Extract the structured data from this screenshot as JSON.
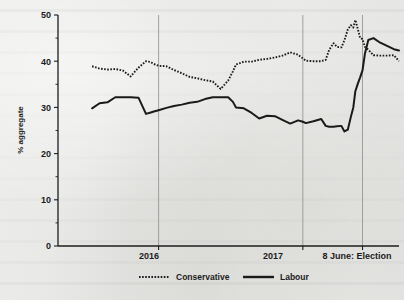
{
  "figure": {
    "background_color": "#e8e8e6",
    "ink_color": "#1a1a1a",
    "gridline_color": "#8d8d8d"
  },
  "axis": {
    "y_title": "% aggregate",
    "y_ticks_major": [
      "0",
      "10",
      "20",
      "30",
      "40",
      "50"
    ],
    "x_ticks": [
      "2016",
      "2017",
      "8 June: Election"
    ]
  },
  "legend": {
    "conservative_label": "Conservative",
    "labour_label": "Labour",
    "conservative_style": "dotted",
    "labour_style": "solid"
  },
  "chart_data": {
    "type": "line",
    "title": "",
    "subtitle": "",
    "xlabel": "",
    "ylabel": "% aggregate",
    "ylim": [
      0,
      50
    ],
    "y_major_ticks": [
      0,
      10,
      20,
      30,
      40,
      50
    ],
    "y_minor_ticks": [
      5,
      15,
      25,
      35,
      45
    ],
    "grid": "vertical-only",
    "legend_position": "bottom-center",
    "x_axis_type": "time",
    "x_tick_labels": [
      "2016",
      "2017",
      "8 June: Election"
    ],
    "x_tick_positions": [
      0.295,
      0.718,
      0.893
    ],
    "annotations": [
      {
        "text": "2016",
        "type": "vertical-gridline",
        "x": 0.295
      },
      {
        "text": "2017",
        "type": "vertical-gridline",
        "x": 0.718
      },
      {
        "text": "8 June: Election",
        "type": "vertical-gridline",
        "x": 0.893
      }
    ],
    "series": [
      {
        "name": "Conservative",
        "style": "dotted",
        "color": "#1a1a1a",
        "x": [
          0.1,
          0.122,
          0.145,
          0.168,
          0.19,
          0.213,
          0.236,
          0.258,
          0.272,
          0.281,
          0.295,
          0.318,
          0.34,
          0.363,
          0.386,
          0.408,
          0.431,
          0.454,
          0.477,
          0.499,
          0.513,
          0.522,
          0.545,
          0.568,
          0.59,
          0.613,
          0.636,
          0.658,
          0.681,
          0.704,
          0.718,
          0.727,
          0.749,
          0.772,
          0.785,
          0.795,
          0.808,
          0.818,
          0.831,
          0.84,
          0.85,
          0.859,
          0.866,
          0.872,
          0.879,
          0.886,
          0.893,
          0.9,
          0.91,
          0.925,
          0.945,
          0.965,
          0.985,
          1.0
        ],
        "values": [
          38.9,
          38.4,
          38.2,
          38.3,
          38.0,
          36.7,
          38.6,
          40.0,
          39.8,
          39.4,
          39.0,
          38.9,
          38.1,
          37.4,
          36.6,
          36.3,
          35.9,
          35.6,
          34.0,
          35.8,
          37.8,
          39.3,
          39.9,
          39.9,
          40.3,
          40.5,
          40.8,
          41.2,
          41.9,
          41.4,
          40.6,
          40.1,
          40.0,
          40.0,
          40.3,
          42.4,
          43.9,
          43.1,
          43.0,
          44.5,
          46.9,
          47.8,
          47.3,
          48.9,
          47.0,
          45.0,
          44.8,
          43.1,
          42.5,
          41.3,
          41.2,
          41.2,
          41.3,
          40.0
        ]
      },
      {
        "name": "Labour",
        "style": "solid",
        "color": "#1a1a1a",
        "x": [
          0.1,
          0.122,
          0.145,
          0.168,
          0.19,
          0.213,
          0.236,
          0.258,
          0.272,
          0.281,
          0.295,
          0.318,
          0.34,
          0.363,
          0.386,
          0.408,
          0.431,
          0.454,
          0.477,
          0.499,
          0.513,
          0.522,
          0.545,
          0.568,
          0.59,
          0.613,
          0.636,
          0.658,
          0.681,
          0.704,
          0.718,
          0.727,
          0.749,
          0.772,
          0.785,
          0.795,
          0.808,
          0.818,
          0.831,
          0.84,
          0.85,
          0.859,
          0.866,
          0.872,
          0.879,
          0.886,
          0.893,
          0.9,
          0.91,
          0.925,
          0.945,
          0.965,
          0.985,
          1.0
        ],
        "values": [
          29.8,
          30.9,
          31.1,
          32.2,
          32.2,
          32.2,
          32.1,
          28.6,
          28.9,
          29.1,
          29.4,
          29.9,
          30.3,
          30.6,
          31.0,
          31.2,
          31.8,
          32.2,
          32.2,
          32.2,
          31.2,
          30.0,
          29.8,
          28.8,
          27.6,
          28.2,
          28.1,
          27.3,
          26.5,
          27.2,
          26.9,
          26.6,
          27.0,
          27.5,
          26.0,
          25.8,
          25.8,
          25.9,
          26.0,
          24.8,
          25.2,
          28.0,
          30.0,
          33.5,
          35.1,
          36.5,
          38.0,
          41.6,
          44.6,
          45.0,
          44.0,
          43.3,
          42.6,
          42.3
        ]
      }
    ]
  }
}
